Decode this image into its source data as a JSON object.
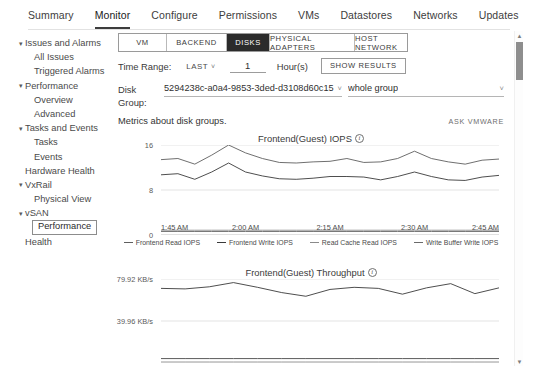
{
  "topnav": {
    "tabs": [
      {
        "label": "Summary",
        "active": false
      },
      {
        "label": "Monitor",
        "active": true
      },
      {
        "label": "Configure",
        "active": false
      },
      {
        "label": "Permissions",
        "active": false
      },
      {
        "label": "VMs",
        "active": false
      },
      {
        "label": "Datastores",
        "active": false
      },
      {
        "label": "Networks",
        "active": false
      },
      {
        "label": "Updates",
        "active": false
      }
    ]
  },
  "sidebar": {
    "items": [
      {
        "label": "Issues and Alarms",
        "level": 0,
        "caret": "▾",
        "selected": false
      },
      {
        "label": "All Issues",
        "level": 1,
        "caret": "",
        "selected": false
      },
      {
        "label": "Triggered Alarms",
        "level": 1,
        "caret": "",
        "selected": false
      },
      {
        "label": "Performance",
        "level": 0,
        "caret": "▾",
        "selected": false
      },
      {
        "label": "Overview",
        "level": 1,
        "caret": "",
        "selected": false
      },
      {
        "label": "Advanced",
        "level": 1,
        "caret": "",
        "selected": false
      },
      {
        "label": "Tasks and Events",
        "level": 0,
        "caret": "▾",
        "selected": false
      },
      {
        "label": "Tasks",
        "level": 1,
        "caret": "",
        "selected": false
      },
      {
        "label": "Events",
        "level": 1,
        "caret": "",
        "selected": false
      },
      {
        "label": "Hardware Health",
        "level": 0,
        "caret": "",
        "selected": false
      },
      {
        "label": "VxRail",
        "level": 0,
        "caret": "▾",
        "selected": false
      },
      {
        "label": "Physical View",
        "level": 1,
        "caret": "",
        "selected": false
      },
      {
        "label": "vSAN",
        "level": 0,
        "caret": "▾",
        "selected": false
      },
      {
        "label": "Performance",
        "level": 1,
        "caret": "",
        "selected": true
      },
      {
        "label": "Health",
        "level": 0,
        "caret": "",
        "selected": false
      }
    ]
  },
  "segmented": {
    "tabs": [
      {
        "label": "VM",
        "active": false,
        "key": "vm"
      },
      {
        "label": "BACKEND",
        "active": false,
        "key": "backend"
      },
      {
        "label": "DISKS",
        "active": true,
        "key": "disks"
      },
      {
        "label": "PHYSICAL ADAPTERS",
        "active": false,
        "key": "phys"
      },
      {
        "label": "HOST NETWORK",
        "active": false,
        "key": "host"
      }
    ]
  },
  "time_range": {
    "label": "Time Range:",
    "mode": "LAST",
    "mode_chevron": "˅",
    "value": "1",
    "placeholder": "1",
    "unit": "Hour(s)",
    "show_results_label": "SHOW RESULTS"
  },
  "disk_group": {
    "label_line1": "Disk",
    "label_line2": "Group:",
    "uuid_value": "5294238c-a0a4-9853-3ded-d3108d60c15",
    "uuid_chevron": "˅",
    "group_value": "whole group",
    "group_chevron": "˅"
  },
  "caption": {
    "text": "Metrics about disk groups.",
    "ask_vmware": "ASK VMWARE"
  },
  "scrollbar": {
    "up_arrow": "▲",
    "down_arrow": "▼"
  },
  "chart_data": [
    {
      "type": "line",
      "title": "Frontend(Guest) IOPS",
      "info_icon": "i",
      "xlabel": "",
      "ylabel": "",
      "ylim": [
        0,
        16
      ],
      "yticks": [
        0,
        8,
        16
      ],
      "ytick_labels": [
        "0",
        "8",
        "16"
      ],
      "grid": true,
      "legend_position": "bottom",
      "xtick_labels": [
        "1:45 AM",
        "2:00 AM",
        "2:15 AM",
        "2:30 AM",
        "2:45 AM"
      ],
      "x": [
        0,
        1,
        2,
        3,
        4,
        5,
        6,
        7,
        8,
        9,
        10,
        11,
        12,
        13,
        14,
        15,
        16,
        17,
        18,
        19,
        20
      ],
      "series": [
        {
          "name": "Frontend Read IOPS",
          "color": "#5f5f5f",
          "values": [
            13.4,
            13.6,
            12.6,
            14.2,
            16.0,
            14.6,
            13.6,
            12.9,
            12.8,
            13.0,
            13.1,
            13.6,
            12.9,
            13.0,
            13.6,
            14.9,
            13.6,
            13.0,
            12.6,
            13.3,
            13.5
          ]
        },
        {
          "name": "Frontend Write IOPS",
          "color": "#3a3a3a",
          "values": [
            10.7,
            10.9,
            9.9,
            11.2,
            12.8,
            11.2,
            10.5,
            10.0,
            9.9,
            10.1,
            10.4,
            10.4,
            10.3,
            9.8,
            10.4,
            11.2,
            10.4,
            9.8,
            9.7,
            10.3,
            10.6
          ]
        },
        {
          "name": "Read Cache Read IOPS",
          "color": "#8a8a8a",
          "values": [
            0.85,
            0.85,
            0.85,
            0.85,
            0.85,
            0.85,
            0.85,
            0.85,
            0.85,
            0.85,
            0.85,
            0.85,
            0.85,
            0.85,
            0.85,
            0.85,
            0.85,
            0.85,
            0.85,
            0.85,
            0.85
          ]
        },
        {
          "name": "Write Buffer Write IOPS",
          "color": "#6a6a6a",
          "values": [
            0.62,
            0.62,
            0.62,
            0.62,
            0.62,
            0.62,
            0.62,
            0.62,
            0.62,
            0.62,
            0.62,
            0.62,
            0.62,
            0.62,
            0.62,
            0.62,
            0.62,
            0.62,
            0.62,
            0.62,
            0.62
          ]
        }
      ]
    },
    {
      "type": "line",
      "title": "Frontend(Guest) Throughput",
      "info_icon": "i",
      "xlabel": "",
      "ylabel": "",
      "ylim": [
        0,
        79.92
      ],
      "yticks": [
        39.96,
        79.92
      ],
      "ytick_labels": [
        "39.96 KB/s",
        "79.92 KB/s"
      ],
      "grid": true,
      "legend_position": "none",
      "xtick_labels": [],
      "x": [
        0,
        1,
        2,
        3,
        4,
        5,
        6,
        7,
        8,
        9,
        10,
        11,
        12,
        13,
        14
      ],
      "series": [
        {
          "name": "Frontend Read Throughput",
          "color": "#3a3a3a",
          "values": [
            71.0,
            70.5,
            72.5,
            76.5,
            72.0,
            67.0,
            63.5,
            70.0,
            72.0,
            71.0,
            65.5,
            71.5,
            75.5,
            66.0,
            71.5
          ]
        },
        {
          "name": "Frontend Write Throughput",
          "color": "#4a4a4a",
          "values": [
            4.2,
            4.2,
            4.2,
            4.2,
            4.2,
            4.2,
            4.2,
            4.2,
            4.2,
            4.2,
            4.2,
            4.2,
            4.2,
            4.2,
            4.2
          ]
        },
        {
          "name": "Read Cache Throughput",
          "color": "#9a9a9a",
          "values": [
            1.0,
            1.0,
            1.0,
            1.0,
            1.0,
            1.0,
            1.0,
            1.0,
            1.0,
            1.0,
            1.0,
            1.0,
            1.0,
            1.0,
            1.0
          ]
        }
      ]
    }
  ]
}
